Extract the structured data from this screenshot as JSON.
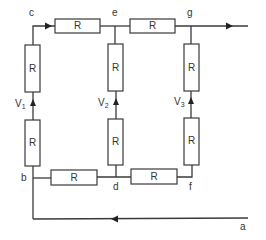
{
  "diagram": {
    "type": "resistor-ladder-circuit",
    "colors": {
      "line": "#3a3a3a",
      "background": "#ffffff",
      "text": "#333333"
    },
    "resistor_label": "R",
    "nodes": {
      "a": "a",
      "b": "b",
      "c": "c",
      "d": "d",
      "e": "e",
      "f": "f",
      "g": "g"
    },
    "voltages": {
      "v1": {
        "main": "V",
        "sub": "1"
      },
      "v2": {
        "main": "V",
        "sub": "2"
      },
      "v3": {
        "main": "V",
        "sub": "3"
      }
    },
    "resistors": [
      {
        "id": "R-ce",
        "label": "R",
        "between": "c-e"
      },
      {
        "id": "R-eg",
        "label": "R",
        "between": "e-g"
      },
      {
        "id": "R-left-top",
        "label": "R",
        "branch": "V1"
      },
      {
        "id": "R-left-bottom",
        "label": "R",
        "branch": "V1"
      },
      {
        "id": "R-mid-top",
        "label": "R",
        "branch": "V2"
      },
      {
        "id": "R-mid-bottom",
        "label": "R",
        "branch": "V2"
      },
      {
        "id": "R-right-top",
        "label": "R",
        "branch": "V3"
      },
      {
        "id": "R-right-bottom",
        "label": "R",
        "branch": "V3"
      },
      {
        "id": "R-bd",
        "label": "R",
        "between": "b-d"
      },
      {
        "id": "R-df",
        "label": "R",
        "between": "d-f"
      }
    ]
  }
}
